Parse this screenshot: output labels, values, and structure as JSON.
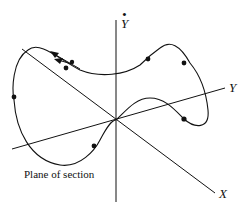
{
  "diagram": {
    "type": "phase-space trajectory with Poincaré section",
    "axes": {
      "x_label": "X",
      "y_label": "Y",
      "ydot_label": "Y",
      "ydot_dot": "•"
    },
    "caption": "Plane of section",
    "colors": {
      "line": "#111111",
      "background": "#ffffff"
    },
    "markers_count": 7,
    "arrows_count": 2
  }
}
